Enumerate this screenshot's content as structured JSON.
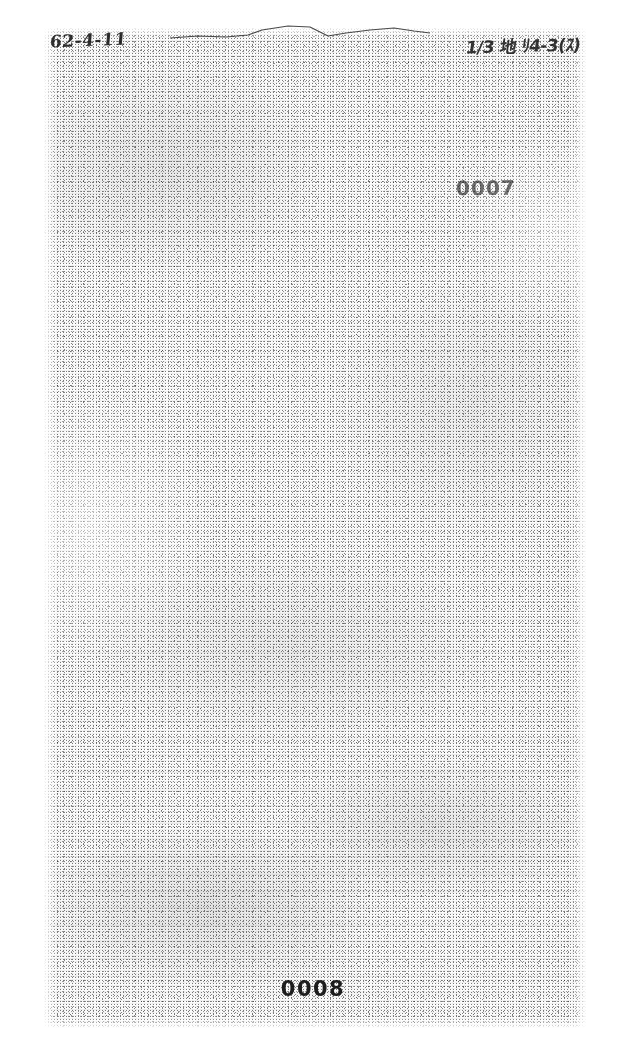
{
  "document": {
    "kind": "degraded-scanned-page",
    "page_background_color": "#ffffff",
    "ink_color": "#141414"
  },
  "annotations": {
    "date_handwritten": "62-4-11",
    "reference_handwritten": "1/3 地 ﾘ4-3(ｽ)"
  },
  "stamps": {
    "archive_number": "0007"
  },
  "footer": {
    "page_number": "0008"
  },
  "body": {
    "legible_text": ""
  }
}
